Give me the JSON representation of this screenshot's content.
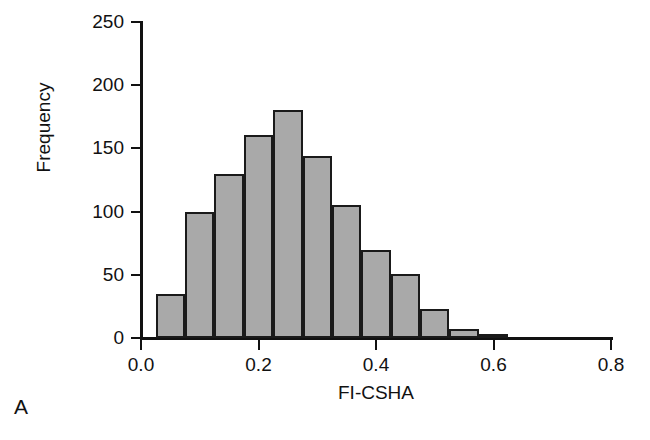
{
  "panel": {
    "label": "A"
  },
  "chart_data": {
    "type": "bar",
    "subtype": "histogram",
    "title": "",
    "xlabel": "FI-CSHA",
    "ylabel": "Frequency",
    "xlim": [
      0.0,
      0.8
    ],
    "ylim": [
      0,
      250
    ],
    "grid": false,
    "legend": null,
    "bin_width": 0.05,
    "bar_color": "#a9a9a9",
    "bar_edge_color": "#1a1a1a",
    "xticks": [
      "0.0",
      "0.2",
      "0.4",
      "0.6",
      "0.8"
    ],
    "xtick_values": [
      0.0,
      0.2,
      0.4,
      0.6,
      0.8
    ],
    "yticks": [
      "0",
      "50",
      "100",
      "150",
      "200",
      "250"
    ],
    "ytick_values": [
      0,
      50,
      100,
      150,
      200,
      250
    ],
    "bins": [
      {
        "x0": 0.025,
        "x1": 0.075,
        "center": 0.05,
        "value": 35
      },
      {
        "x0": 0.075,
        "x1": 0.125,
        "center": 0.1,
        "value": 100
      },
      {
        "x0": 0.125,
        "x1": 0.175,
        "center": 0.15,
        "value": 130
      },
      {
        "x0": 0.175,
        "x1": 0.225,
        "center": 0.2,
        "value": 161
      },
      {
        "x0": 0.225,
        "x1": 0.275,
        "center": 0.25,
        "value": 180
      },
      {
        "x0": 0.275,
        "x1": 0.325,
        "center": 0.3,
        "value": 144
      },
      {
        "x0": 0.325,
        "x1": 0.375,
        "center": 0.35,
        "value": 105
      },
      {
        "x0": 0.375,
        "x1": 0.425,
        "center": 0.4,
        "value": 70
      },
      {
        "x0": 0.425,
        "x1": 0.475,
        "center": 0.45,
        "value": 51
      },
      {
        "x0": 0.475,
        "x1": 0.525,
        "center": 0.5,
        "value": 23
      },
      {
        "x0": 0.525,
        "x1": 0.575,
        "center": 0.55,
        "value": 7
      },
      {
        "x0": 0.575,
        "x1": 0.625,
        "center": 0.6,
        "value": 2
      }
    ],
    "categories": [
      0.05,
      0.1,
      0.15,
      0.2,
      0.25,
      0.3,
      0.35,
      0.4,
      0.45,
      0.5,
      0.55,
      0.6
    ],
    "values": [
      35,
      100,
      130,
      161,
      180,
      144,
      105,
      70,
      51,
      23,
      7,
      2
    ]
  }
}
